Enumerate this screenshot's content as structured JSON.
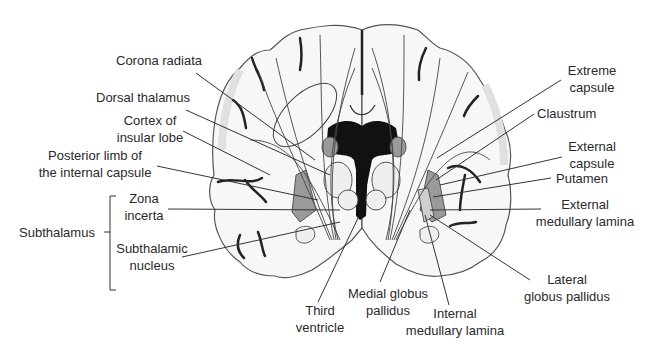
{
  "diagram": {
    "colors": {
      "outline": "#555555",
      "ventricle": "#111111",
      "gray_nucleus": "#9a9a9a",
      "light_nucleus": "#cfcfcf",
      "cortex_shade": "#e4e4e4",
      "leader_line": "#333333"
    },
    "labels_left": {
      "corona_radiata": "Corona radiata",
      "dorsal_thalamus": "Dorsal thalamus",
      "cortex_insular_1": "Cortex of",
      "cortex_insular_2": "insular lobe",
      "posterior_limb_1": "Posterior limb of",
      "posterior_limb_2": "the internal capsule",
      "subthalamus": "Subthalamus",
      "zona_incerta_1": "Zona",
      "zona_incerta_2": "incerta",
      "subthalamic_nucleus_1": "Subthalamic",
      "subthalamic_nucleus_2": "nucleus"
    },
    "labels_right": {
      "extreme_capsule_1": "Extreme",
      "extreme_capsule_2": "capsule",
      "claustrum": "Claustrum",
      "external_capsule_1": "External",
      "external_capsule_2": "capsule",
      "putamen": "Putamen",
      "external_medullary_lamina_1": "External",
      "external_medullary_lamina_2": "medullary lamina",
      "lateral_globus_pallidus_1": "Lateral",
      "lateral_globus_pallidus_2": "globus pallidus"
    },
    "labels_bottom": {
      "third_ventricle_1": "Third",
      "third_ventricle_2": "ventricle",
      "medial_globus_pallidus_1": "Medial globus",
      "medial_globus_pallidus_2": "pallidus",
      "internal_medullary_lamina_1": "Internal",
      "internal_medullary_lamina_2": "medullary lamina"
    }
  }
}
